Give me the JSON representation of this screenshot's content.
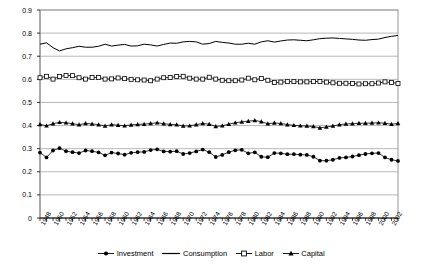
{
  "chart_data": {
    "type": "line",
    "title": "",
    "subtitle": "",
    "xlabel": "",
    "ylabel": "",
    "ylim": [
      0,
      0.9
    ],
    "ytick_step": 0.1,
    "yticks": [
      "0",
      "0.1",
      "0.2",
      "0.3",
      "0.4",
      "0.5",
      "0.6",
      "0.7",
      "0.8",
      "0.9"
    ],
    "grid": true,
    "legend_position": "bottom",
    "x": [
      1948,
      1949,
      1950,
      1951,
      1952,
      1953,
      1954,
      1955,
      1956,
      1957,
      1958,
      1959,
      1960,
      1961,
      1962,
      1963,
      1964,
      1965,
      1966,
      1967,
      1968,
      1969,
      1970,
      1971,
      1972,
      1973,
      1974,
      1975,
      1976,
      1977,
      1978,
      1979,
      1980,
      1981,
      1982,
      1983,
      1984,
      1985,
      1986,
      1987,
      1988,
      1989,
      1990,
      1991,
      1992,
      1993,
      1994,
      1995,
      1996,
      1997,
      1998,
      1999,
      2000,
      2001,
      2002,
      2003
    ],
    "xtick_labels": [
      "1948",
      "1950",
      "1952",
      "1954",
      "1956",
      "1958",
      "1960",
      "1962",
      "1964",
      "1966",
      "1968",
      "1970",
      "1972",
      "1974",
      "1976",
      "1978",
      "1980",
      "1982",
      "1984",
      "1986",
      "1988",
      "1990",
      "1992",
      "1994",
      "1996",
      "1998",
      "2000",
      "2002"
    ],
    "xtick_step": 2,
    "series": [
      {
        "name": "Investment",
        "marker": "filled-circle",
        "color": "#000000",
        "values": [
          0.283,
          0.262,
          0.292,
          0.302,
          0.289,
          0.285,
          0.281,
          0.292,
          0.289,
          0.284,
          0.271,
          0.283,
          0.279,
          0.274,
          0.282,
          0.285,
          0.286,
          0.294,
          0.297,
          0.288,
          0.287,
          0.289,
          0.277,
          0.281,
          0.288,
          0.296,
          0.285,
          0.264,
          0.273,
          0.285,
          0.293,
          0.295,
          0.28,
          0.284,
          0.265,
          0.263,
          0.281,
          0.28,
          0.276,
          0.276,
          0.274,
          0.273,
          0.265,
          0.248,
          0.248,
          0.252,
          0.26,
          0.262,
          0.266,
          0.272,
          0.277,
          0.28,
          0.281,
          0.262,
          0.252,
          0.247
        ]
      },
      {
        "name": "Consumption",
        "marker": "none",
        "color": "#000000",
        "values": [
          0.752,
          0.758,
          0.737,
          0.723,
          0.732,
          0.737,
          0.743,
          0.739,
          0.739,
          0.743,
          0.752,
          0.744,
          0.748,
          0.751,
          0.744,
          0.745,
          0.752,
          0.749,
          0.744,
          0.751,
          0.757,
          0.756,
          0.762,
          0.764,
          0.762,
          0.752,
          0.755,
          0.764,
          0.76,
          0.757,
          0.752,
          0.752,
          0.756,
          0.752,
          0.762,
          0.767,
          0.761,
          0.766,
          0.77,
          0.771,
          0.769,
          0.767,
          0.771,
          0.776,
          0.778,
          0.779,
          0.777,
          0.775,
          0.773,
          0.77,
          0.769,
          0.772,
          0.774,
          0.781,
          0.786,
          0.79
        ]
      },
      {
        "name": "Labor",
        "marker": "open-square",
        "color": "#000000",
        "values": [
          0.607,
          0.613,
          0.601,
          0.612,
          0.617,
          0.616,
          0.607,
          0.601,
          0.608,
          0.608,
          0.601,
          0.602,
          0.606,
          0.603,
          0.6,
          0.598,
          0.597,
          0.594,
          0.601,
          0.607,
          0.608,
          0.612,
          0.613,
          0.605,
          0.601,
          0.601,
          0.609,
          0.601,
          0.596,
          0.594,
          0.594,
          0.597,
          0.605,
          0.598,
          0.604,
          0.596,
          0.586,
          0.588,
          0.59,
          0.59,
          0.589,
          0.589,
          0.59,
          0.591,
          0.588,
          0.585,
          0.583,
          0.583,
          0.582,
          0.58,
          0.581,
          0.581,
          0.584,
          0.589,
          0.586,
          0.582
        ]
      },
      {
        "name": "Capital",
        "marker": "filled-triangle",
        "color": "#000000",
        "values": [
          0.405,
          0.399,
          0.408,
          0.414,
          0.412,
          0.408,
          0.404,
          0.409,
          0.407,
          0.404,
          0.398,
          0.404,
          0.402,
          0.399,
          0.403,
          0.405,
          0.406,
          0.409,
          0.412,
          0.408,
          0.405,
          0.404,
          0.398,
          0.399,
          0.404,
          0.409,
          0.406,
          0.396,
          0.399,
          0.406,
          0.412,
          0.416,
          0.419,
          0.422,
          0.417,
          0.408,
          0.411,
          0.409,
          0.404,
          0.401,
          0.399,
          0.398,
          0.396,
          0.39,
          0.394,
          0.398,
          0.404,
          0.407,
          0.408,
          0.41,
          0.41,
          0.411,
          0.412,
          0.41,
          0.406,
          0.409
        ]
      }
    ]
  },
  "legend": {
    "items": [
      {
        "label": "Investment",
        "marker": "filled-circle"
      },
      {
        "label": "Consumption",
        "marker": "none"
      },
      {
        "label": "Labor",
        "marker": "open-square"
      },
      {
        "label": "Capital",
        "marker": "filled-triangle"
      }
    ]
  }
}
